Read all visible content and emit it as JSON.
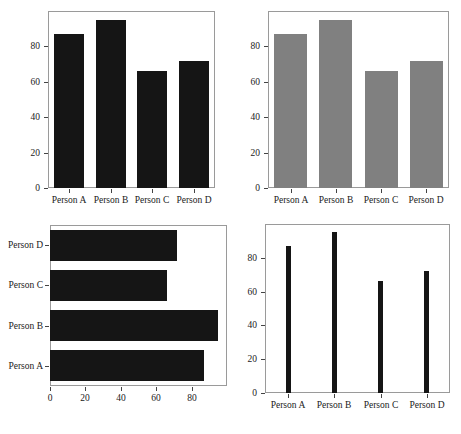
{
  "figure": {
    "background_color": "#ffffff",
    "panel_count": 4,
    "frame_color": "#9a9a9a"
  },
  "chart_data": [
    {
      "type": "bar",
      "orientation": "vertical",
      "panel": "top-left",
      "title": "",
      "xlabel": "",
      "ylabel": "",
      "categories": [
        "Person A",
        "Person B",
        "Person C",
        "Person D"
      ],
      "values": [
        87,
        95,
        66,
        72
      ],
      "ylim": [
        0,
        100
      ],
      "yticks": [
        0,
        20,
        40,
        60,
        80
      ],
      "ytick_labels": [
        "0",
        "20",
        "40",
        "60",
        "80"
      ],
      "bar_color": "#151515",
      "bar_width_ratio": 0.72,
      "grid": false,
      "legend": false
    },
    {
      "type": "bar",
      "orientation": "vertical",
      "panel": "top-right",
      "title": "",
      "xlabel": "",
      "ylabel": "",
      "categories": [
        "Person A",
        "Person B",
        "Person C",
        "Person D"
      ],
      "values": [
        87,
        95,
        66,
        72
      ],
      "ylim": [
        0,
        100
      ],
      "yticks": [
        0,
        20,
        40,
        60,
        80
      ],
      "ytick_labels": [
        "0",
        "20",
        "40",
        "60",
        "80"
      ],
      "bar_color": "#808080",
      "bar_width_ratio": 0.72,
      "grid": false,
      "legend": false
    },
    {
      "type": "bar",
      "orientation": "horizontal",
      "panel": "bottom-left",
      "title": "",
      "xlabel": "",
      "ylabel": "",
      "categories": [
        "Person A",
        "Person B",
        "Person C",
        "Person D"
      ],
      "values": [
        87,
        95,
        66,
        72
      ],
      "xlim": [
        0,
        100
      ],
      "xticks": [
        0,
        20,
        40,
        60,
        80
      ],
      "xtick_labels": [
        "0",
        "20",
        "40",
        "60",
        "80"
      ],
      "bar_color": "#151515",
      "bar_width_ratio": 0.78,
      "grid": false,
      "legend": false
    },
    {
      "type": "bar",
      "orientation": "vertical",
      "panel": "bottom-right",
      "title": "",
      "xlabel": "",
      "ylabel": "",
      "categories": [
        "Person A",
        "Person B",
        "Person C",
        "Person D"
      ],
      "values": [
        87,
        95,
        66,
        72
      ],
      "ylim": [
        0,
        100
      ],
      "yticks": [
        0,
        20,
        40,
        60,
        80
      ],
      "ytick_labels": [
        "0",
        "20",
        "40",
        "60",
        "80"
      ],
      "bar_color": "#151515",
      "bar_width_ratio": 0.1,
      "grid": false,
      "legend": false
    }
  ]
}
